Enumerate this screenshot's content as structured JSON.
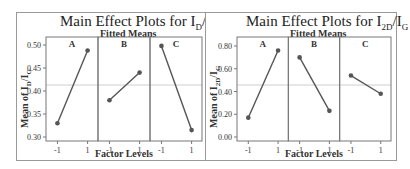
{
  "chart_data": [
    {
      "type": "line",
      "title": "Main Effect Plots for ID/IG",
      "title_main": "Main Effect Plots for I",
      "title_sub1": "D",
      "title_mid": "/I",
      "title_sub2": "G",
      "subtitle": "Fitted Means",
      "xlabel": "Factor Levels",
      "ylabel": "Mean of ID/IG",
      "ylabel_main": "Mean of I",
      "ylabel_sub1": "D",
      "ylabel_mid": "/I",
      "ylabel_sub2": "G",
      "ylim": [
        0.295,
        0.515
      ],
      "yticks": [
        0.3,
        0.35,
        0.4,
        0.45,
        0.5
      ],
      "ytick_labels": [
        "0.30",
        "0.35",
        "0.40",
        "0.45",
        "0.50"
      ],
      "reference_line": 0.413,
      "categories": [
        "-1",
        "1"
      ],
      "panels": [
        {
          "name": "A",
          "values": [
            0.33,
            0.488
          ]
        },
        {
          "name": "B",
          "values": [
            0.38,
            0.44
          ]
        },
        {
          "name": "C",
          "values": [
            0.498,
            0.315
          ]
        }
      ],
      "grid": false
    },
    {
      "type": "line",
      "title": "Main Effect Plots for I2D/IG",
      "title_main": "Main Effect Plots for I",
      "title_sub1": "2D",
      "title_mid": "/I",
      "title_sub2": "G",
      "subtitle": "Fitted Means",
      "xlabel": "Factor Levels",
      "ylabel": "Mean of I2D/IG",
      "ylabel_main": "Mean of I",
      "ylabel_sub1": "2D",
      "ylabel_mid": "/I",
      "ylabel_sub2": "G",
      "ylim": [
        -0.01,
        0.87
      ],
      "yticks": [
        0.0,
        0.2,
        0.4,
        0.6,
        0.8
      ],
      "ytick_labels": [
        "0.00",
        "0.20",
        "0.40",
        "0.60",
        "0.80"
      ],
      "reference_line": 0.457,
      "categories": [
        "-1",
        "1"
      ],
      "panels": [
        {
          "name": "A",
          "values": [
            0.17,
            0.76
          ]
        },
        {
          "name": "B",
          "values": [
            0.7,
            0.23
          ]
        },
        {
          "name": "C",
          "values": [
            0.54,
            0.38
          ]
        }
      ],
      "grid": false
    }
  ],
  "colors": {
    "line": "#555555",
    "marker": "#555555",
    "reference": "#cfcfcf",
    "frame": "#777777"
  }
}
